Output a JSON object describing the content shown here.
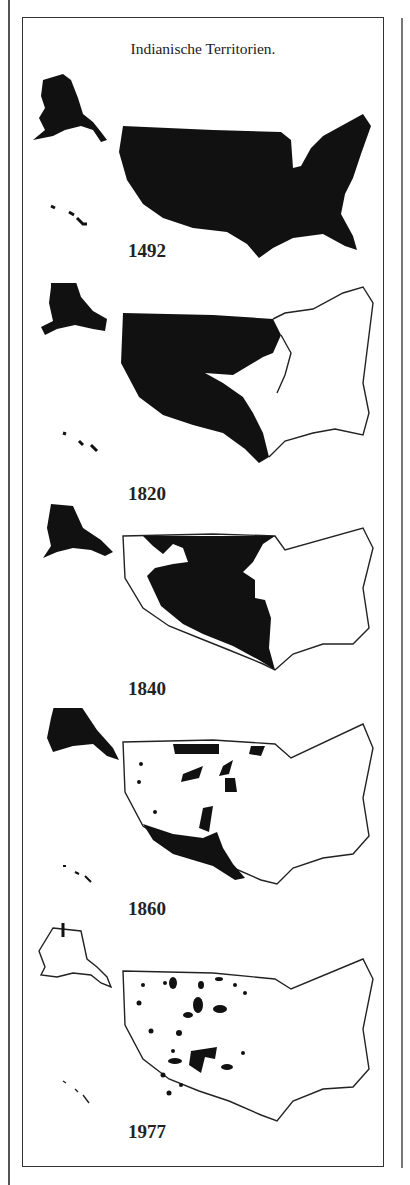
{
  "title": "Indianische Territorien.",
  "panels": [
    {
      "year": "1492",
      "coverage": "full"
    },
    {
      "year": "1820",
      "coverage": "west-majority"
    },
    {
      "year": "1840",
      "coverage": "west-central"
    },
    {
      "year": "1860",
      "coverage": "scattered"
    },
    {
      "year": "1977",
      "coverage": "reservations"
    }
  ],
  "colors": {
    "territory": "#111111",
    "outline": "#222222",
    "background": "#ffffff",
    "frame": "#333333"
  }
}
